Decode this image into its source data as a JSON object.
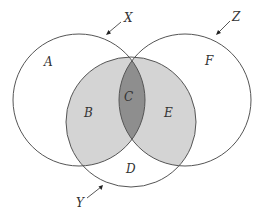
{
  "diagram": {
    "type": "venn",
    "sets": [
      {
        "name": "X",
        "label": "X",
        "cx": 79,
        "cy": 100,
        "r": 66
      },
      {
        "name": "Y",
        "label": "Y",
        "cx": 131,
        "cy": 122,
        "r": 65
      },
      {
        "name": "Z",
        "label": "Z",
        "cx": 185,
        "cy": 100,
        "r": 66
      }
    ],
    "regions": {
      "A": {
        "label": "A",
        "description": "X only"
      },
      "B": {
        "label": "B",
        "description": "X and Y, not Z"
      },
      "C": {
        "label": "C",
        "description": "X and Y and Z"
      },
      "D": {
        "label": "D",
        "description": "Y only"
      },
      "E": {
        "label": "E",
        "description": "Y and Z, not X"
      },
      "F": {
        "label": "F",
        "description": "Z only"
      }
    },
    "colors": {
      "background": "#ffffff",
      "outline": "#555555",
      "shade_light": "#d4d4d4",
      "shade_dark": "#8e8e8e",
      "text": "#333333"
    }
  }
}
